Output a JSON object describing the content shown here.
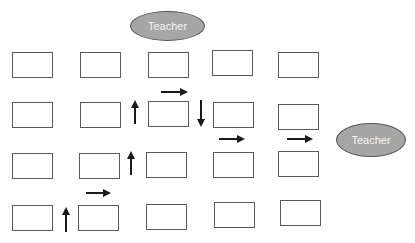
{
  "teachers": [
    {
      "label": "Teacher",
      "x": 130,
      "y": 11,
      "w": 75,
      "h": 30
    },
    {
      "label": "Teacher",
      "x": 336,
      "y": 123,
      "w": 70,
      "h": 34
    }
  ],
  "desks": [
    {
      "row": 1,
      "col": 1,
      "x": 12,
      "y": 52,
      "w": 41,
      "h": 26
    },
    {
      "row": 1,
      "col": 2,
      "x": 80,
      "y": 52,
      "w": 41,
      "h": 26
    },
    {
      "row": 1,
      "col": 3,
      "x": 148,
      "y": 52,
      "w": 41,
      "h": 26
    },
    {
      "row": 1,
      "col": 4,
      "x": 212,
      "y": 50,
      "w": 41,
      "h": 26
    },
    {
      "row": 1,
      "col": 5,
      "x": 278,
      "y": 52,
      "w": 41,
      "h": 26
    },
    {
      "row": 2,
      "col": 1,
      "x": 12,
      "y": 102,
      "w": 41,
      "h": 26
    },
    {
      "row": 2,
      "col": 2,
      "x": 80,
      "y": 102,
      "w": 41,
      "h": 26
    },
    {
      "row": 2,
      "col": 3,
      "x": 148,
      "y": 101,
      "w": 41,
      "h": 26
    },
    {
      "row": 2,
      "col": 4,
      "x": 213,
      "y": 102,
      "w": 41,
      "h": 26
    },
    {
      "row": 2,
      "col": 5,
      "x": 278,
      "y": 104,
      "w": 41,
      "h": 26
    },
    {
      "row": 3,
      "col": 1,
      "x": 12,
      "y": 153,
      "w": 41,
      "h": 26
    },
    {
      "row": 3,
      "col": 2,
      "x": 79,
      "y": 153,
      "w": 41,
      "h": 26
    },
    {
      "row": 3,
      "col": 3,
      "x": 146,
      "y": 152,
      "w": 41,
      "h": 26
    },
    {
      "row": 3,
      "col": 4,
      "x": 213,
      "y": 152,
      "w": 41,
      "h": 26
    },
    {
      "row": 3,
      "col": 5,
      "x": 278,
      "y": 151,
      "w": 41,
      "h": 26
    },
    {
      "row": 4,
      "col": 1,
      "x": 12,
      "y": 205,
      "w": 41,
      "h": 26
    },
    {
      "row": 4,
      "col": 2,
      "x": 78,
      "y": 205,
      "w": 41,
      "h": 26
    },
    {
      "row": 4,
      "col": 3,
      "x": 146,
      "y": 204,
      "w": 41,
      "h": 26
    },
    {
      "row": 4,
      "col": 4,
      "x": 214,
      "y": 202,
      "w": 41,
      "h": 26
    },
    {
      "row": 4,
      "col": 5,
      "x": 280,
      "y": 200,
      "w": 41,
      "h": 26
    }
  ],
  "arrows": [
    {
      "direction": "up",
      "x1": 66,
      "y1": 232,
      "x2": 66,
      "y2": 210
    },
    {
      "direction": "right",
      "x1": 86,
      "y1": 193,
      "x2": 108,
      "y2": 193
    },
    {
      "direction": "up",
      "x1": 131,
      "y1": 175,
      "x2": 131,
      "y2": 154
    },
    {
      "direction": "up",
      "x1": 135,
      "y1": 124,
      "x2": 135,
      "y2": 103
    },
    {
      "direction": "right",
      "x1": 161,
      "y1": 92,
      "x2": 185,
      "y2": 92
    },
    {
      "direction": "down",
      "x1": 201,
      "y1": 100,
      "x2": 201,
      "y2": 124
    },
    {
      "direction": "right",
      "x1": 219,
      "y1": 139,
      "x2": 242,
      "y2": 139
    },
    {
      "direction": "right",
      "x1": 287,
      "y1": 139,
      "x2": 310,
      "y2": 139
    }
  ],
  "colors": {
    "desk_border": "#5a5a5a",
    "teacher_fill": "#a6a6a6",
    "teacher_text": "#f4f4f4",
    "arrow": "#1a1a1a"
  }
}
